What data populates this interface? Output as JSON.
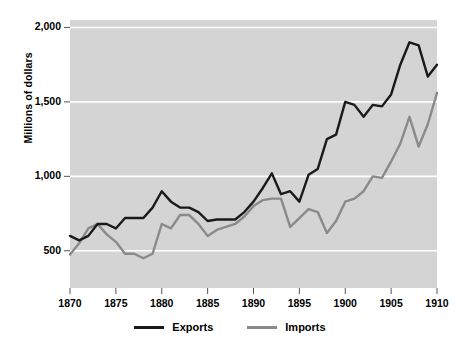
{
  "chart_data": {
    "type": "line",
    "title": "",
    "xlabel": "",
    "ylabel": "Millions of dollars",
    "xlim": [
      1870,
      1910
    ],
    "ylim": [
      250,
      2050
    ],
    "grid": true,
    "grid_axis": "y",
    "legend_position": "bottom-center",
    "plot_background": "#d4d4d4",
    "y_ticks": [
      500,
      1000,
      1500,
      2000
    ],
    "y_tick_labels": [
      "500",
      "1,000",
      "1,500",
      "2,000"
    ],
    "x_ticks": [
      1870,
      1875,
      1880,
      1885,
      1890,
      1895,
      1900,
      1905,
      1910
    ],
    "x_tick_labels": [
      "1870",
      "1875",
      "1880",
      "1885",
      "1890",
      "1895",
      "1900",
      "1905",
      "1910"
    ],
    "x": [
      1870,
      1871,
      1872,
      1873,
      1874,
      1875,
      1876,
      1877,
      1878,
      1879,
      1880,
      1881,
      1882,
      1883,
      1884,
      1885,
      1886,
      1887,
      1888,
      1889,
      1890,
      1891,
      1892,
      1893,
      1894,
      1895,
      1896,
      1897,
      1898,
      1899,
      1900,
      1901,
      1902,
      1903,
      1904,
      1905,
      1906,
      1907,
      1908,
      1909,
      1910
    ],
    "series": [
      {
        "name": "Exports",
        "color": "#1a1a1a",
        "values": [
          600,
          570,
          600,
          680,
          680,
          650,
          720,
          720,
          720,
          790,
          900,
          830,
          790,
          790,
          760,
          700,
          710,
          710,
          710,
          760,
          830,
          920,
          1020,
          880,
          900,
          830,
          1010,
          1050,
          1250,
          1280,
          1500,
          1480,
          1400,
          1480,
          1470,
          1550,
          1750,
          1900,
          1880,
          1670,
          1750
        ]
      },
      {
        "name": "Imports",
        "color": "#8a8a8a",
        "values": [
          475,
          550,
          650,
          680,
          610,
          560,
          480,
          480,
          450,
          480,
          680,
          650,
          740,
          740,
          680,
          600,
          640,
          660,
          680,
          730,
          800,
          840,
          850,
          850,
          660,
          720,
          780,
          760,
          620,
          700,
          830,
          850,
          900,
          1000,
          990,
          1100,
          1220,
          1400,
          1200,
          1350,
          1560
        ]
      }
    ]
  },
  "legend": {
    "items": [
      {
        "label": "Exports",
        "color": "#1a1a1a"
      },
      {
        "label": "Imports",
        "color": "#8a8a8a"
      }
    ]
  }
}
